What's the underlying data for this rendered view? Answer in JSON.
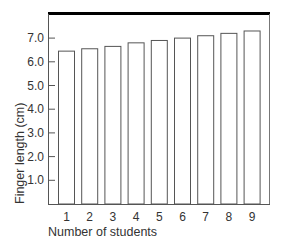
{
  "chart_data": {
    "type": "bar",
    "title": "",
    "xlabel": "Number of students",
    "ylabel": "Finger length (cm)",
    "categories": [
      "1",
      "2",
      "3",
      "4",
      "5",
      "6",
      "7",
      "8",
      "9"
    ],
    "values": [
      6.45,
      6.55,
      6.65,
      6.8,
      6.9,
      7.0,
      7.1,
      7.2,
      7.3
    ],
    "yticks": [
      "1.0",
      "2.0",
      "3.0",
      "4.0",
      "5.0",
      "6.0",
      "7.0"
    ],
    "ylim": [
      0,
      8
    ],
    "grid": false,
    "legend": null,
    "colors": {
      "bar_fill": "#ffffff",
      "bar_stroke": "#555555",
      "axis": "#555555",
      "top_border": "#000000"
    }
  }
}
